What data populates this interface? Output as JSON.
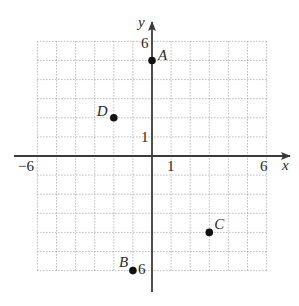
{
  "chart_data": {
    "type": "scatter",
    "title": "",
    "xlabel": "x",
    "ylabel": "y",
    "xlim": [
      -6,
      6
    ],
    "ylim": [
      -6,
      6
    ],
    "grid": true,
    "grid_style": "dotted",
    "x_tick_labels": [
      {
        "value": -6,
        "label": "−6"
      },
      {
        "value": 1,
        "label": "1"
      },
      {
        "value": 6,
        "label": "6"
      }
    ],
    "y_tick_labels": [
      {
        "value": 6,
        "label": "6"
      },
      {
        "value": 1,
        "label": "1"
      },
      {
        "value": -6,
        "label": "−6"
      }
    ],
    "points": [
      {
        "label": "A",
        "x": 0,
        "y": 5
      },
      {
        "label": "B",
        "x": -1,
        "y": -6
      },
      {
        "label": "C",
        "x": 3,
        "y": -4
      },
      {
        "label": "D",
        "x": -2,
        "y": 2
      }
    ],
    "colors": {
      "axis": "#3a3a3a",
      "grid": "#9a9a9a",
      "point": "#111111",
      "text": "#2a2a2a"
    }
  },
  "labels": {
    "x_axis": "x",
    "y_axis": "y",
    "x_min": "−6",
    "x_one": "1",
    "x_max": "6",
    "y_max": "6",
    "y_one": "1",
    "y_min": "6",
    "point_a": "A",
    "point_b": "B",
    "point_c": "C",
    "point_d": "D"
  }
}
